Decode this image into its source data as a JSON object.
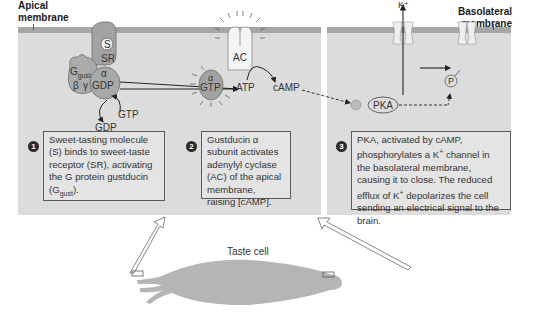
{
  "labels": {
    "apical_membrane": [
      "Apical",
      "membrane"
    ],
    "basolateral_membrane": [
      "Basolateral",
      "membrane"
    ],
    "taste_cell": "Taste cell"
  },
  "molecules": {
    "sweet_molecule": "S",
    "sweet_receptor": "SR",
    "g_protein_main": "G",
    "g_protein_sub": "gust",
    "beta": "β",
    "gamma": "γ",
    "alpha": "α",
    "gdp": "GDP",
    "gtp": "GTP",
    "gdp_released": "GDP",
    "gtp_incoming": "GTP",
    "adenylyl_cyclase": "AC",
    "atp": "ATP",
    "camp": "cAMP",
    "pka": "PKA",
    "phosphate": "P",
    "potassium": "K⁺"
  },
  "steps": [
    {
      "number": "1",
      "text_parts": [
        "Sweet-tasting molecule (S) binds to sweet-taste receptor (SR), activating the G protein gustducin (G",
        "gust",
        ")."
      ]
    },
    {
      "number": "2",
      "text": "Gustducin α subunit activates adenylyl cyclase (AC) of the apical membrane, raising [cAMP]."
    },
    {
      "number": "3",
      "text_parts": [
        "PKA, activated by cAMP, phosphorylates a K",
        "+",
        " channel in the basolateral membrane, causing it to close. The reduced efflux of K",
        "+",
        " depolarizes the cell sending an electrical signal to the brain."
      ]
    }
  ],
  "colors": {
    "panel_bg": "#dcdcdc",
    "membrane": "#a6a6a6",
    "protein": "#a9a9a9",
    "cell_body": "#b5b5b5",
    "text": "#2b2b2b"
  }
}
